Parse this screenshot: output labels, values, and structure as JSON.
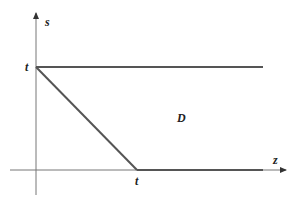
{
  "diagram": {
    "axes": {
      "vertical_label": "s",
      "horizontal_label": "z"
    },
    "labels": {
      "s_intercept": "t",
      "z_intercept": "t",
      "region": "D"
    },
    "colors": {
      "line": "#555555",
      "axis": "#777777",
      "text": "#222222"
    }
  }
}
